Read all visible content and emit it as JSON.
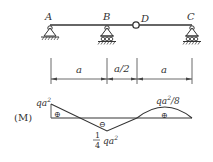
{
  "beam": {
    "nodes": [
      {
        "id": "A",
        "label": "A",
        "support": "pin"
      },
      {
        "id": "B",
        "label": "B",
        "support": "roller"
      },
      {
        "id": "D",
        "label": "D",
        "support": "hinge"
      },
      {
        "id": "C",
        "label": "C",
        "support": "roller"
      }
    ]
  },
  "dimensions": {
    "spans": [
      {
        "label": "a",
        "from": "A",
        "to": "B"
      },
      {
        "label": "a/2",
        "from": "B",
        "to": "D"
      },
      {
        "label": "a",
        "from": "D",
        "to": "C"
      }
    ]
  },
  "moment_diagram": {
    "title": "(M)",
    "left_value": "qa",
    "left_value_sup": "2",
    "min_value_frac_num": "1",
    "min_value_frac_den": "4",
    "min_value_tail": "qa",
    "min_value_sup": "2",
    "right_value": "qa",
    "right_value_sup": "2",
    "right_value_tail": "/8",
    "signs": [
      "⊕",
      "⊖",
      "⊕"
    ]
  },
  "colors": {
    "line": "#333333",
    "baseline": "#777777"
  }
}
